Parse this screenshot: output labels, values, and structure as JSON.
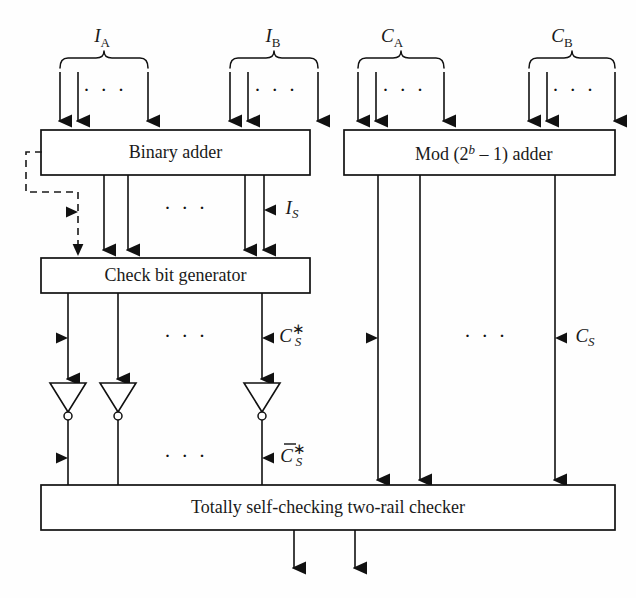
{
  "figure": {
    "kind": "block-diagram",
    "title_visible": false,
    "background_color": "#fefefe",
    "line_color": "#111111"
  },
  "blocks": [
    {
      "id": "binary-adder",
      "label": "Binary adder",
      "x": 41,
      "y": 130,
      "w": 269,
      "h": 45
    },
    {
      "id": "mod-adder",
      "label": "Mod (2",
      "label_sup": "b",
      "label_tail": " – 1) adder",
      "label_full": "Mod (2b – 1) adder",
      "x": 344,
      "y": 130,
      "w": 271,
      "h": 45
    },
    {
      "id": "check-bit-generator",
      "label": "Check bit generator",
      "x": 41,
      "y": 258,
      "w": 269,
      "h": 35
    },
    {
      "id": "two-rail-checker",
      "label": "Totally self-checking two-rail checker",
      "x": 41,
      "y": 485,
      "w": 574,
      "h": 45
    }
  ],
  "input_groups": [
    {
      "id": "group-IA",
      "label": "I",
      "sub": "A",
      "label_x": 102,
      "label_y": 38,
      "brace_x1": 60,
      "brace_x2": 148,
      "brace_y": 62
    },
    {
      "id": "group-IB",
      "label": "I",
      "sub": "B",
      "label_x": 273,
      "label_y": 38,
      "brace_x1": 230,
      "brace_x2": 318,
      "brace_y": 62
    },
    {
      "id": "group-CA",
      "label": "C",
      "sub": "A",
      "label_x": 392,
      "label_y": 38,
      "brace_x1": 358,
      "brace_x2": 444,
      "brace_y": 62
    },
    {
      "id": "group-CB",
      "label": "C",
      "sub": "B",
      "label_x": 562,
      "label_y": 38,
      "brace_x1": 529,
      "brace_x2": 615,
      "brace_y": 62
    }
  ],
  "signal_labels": [
    {
      "id": "label-IS",
      "base": "I",
      "sub": "S",
      "bar": false,
      "star": false,
      "x": 264,
      "y": 210
    },
    {
      "id": "label-CSstar",
      "base": "C",
      "sub": "S",
      "bar": false,
      "star": true,
      "x": 279,
      "y": 338
    },
    {
      "id": "label-CSbarstar",
      "base": "C",
      "sub": "S",
      "bar": true,
      "star": true,
      "x": 279,
      "y": 458
    },
    {
      "id": "label-CS",
      "base": "C",
      "sub": "S",
      "bar": false,
      "star": false,
      "x": 580,
      "y": 338
    }
  ],
  "ellipses": [
    {
      "id": "dots-IA-top",
      "x": 105,
      "y": 92
    },
    {
      "id": "dots-IB-top",
      "x": 276,
      "y": 92
    },
    {
      "id": "dots-CA-top",
      "x": 404,
      "y": 92
    },
    {
      "id": "dots-CB-top",
      "x": 574,
      "y": 92
    },
    {
      "id": "dots-mid-left",
      "x": 186,
      "y": 210
    },
    {
      "id": "dots-cbg-out",
      "x": 186,
      "y": 338
    },
    {
      "id": "dots-inv-out",
      "x": 186,
      "y": 458
    },
    {
      "id": "dots-right-mid",
      "x": 486,
      "y": 338
    }
  ],
  "inverters": [
    {
      "id": "inverter-1",
      "x": 68,
      "top": 383,
      "bottom": 416
    },
    {
      "id": "inverter-2",
      "x": 118,
      "top": 383,
      "bottom": 416
    },
    {
      "id": "inverter-3",
      "x": 262,
      "top": 383,
      "bottom": 416
    }
  ],
  "feedback": {
    "id": "dashed-feedback",
    "description": "dashed feedback from binary adder left edge to check bit generator input",
    "path": "M 42 152 L 26 152 L 26 192 L 78 192 L 78 254"
  },
  "outputs": [
    {
      "id": "output-arrow-left",
      "x": 294,
      "y1": 530,
      "y2": 572
    },
    {
      "id": "output-arrow-right",
      "x": 355,
      "y1": 530,
      "y2": 572
    }
  ],
  "colors": {
    "ink": "#111111",
    "paper": "#fefefe",
    "box_fill": "#ffffff"
  }
}
